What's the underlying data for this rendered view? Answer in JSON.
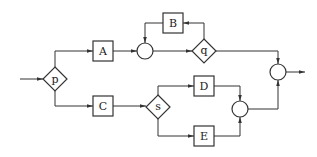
{
  "diagram": {
    "type": "flowchart",
    "nodes": {
      "p": {
        "label": "p",
        "shape": "diamond"
      },
      "q": {
        "label": "q",
        "shape": "diamond"
      },
      "s": {
        "label": "s",
        "shape": "diamond"
      },
      "A": {
        "label": "A",
        "shape": "box"
      },
      "B": {
        "label": "B",
        "shape": "box"
      },
      "C": {
        "label": "C",
        "shape": "box"
      },
      "D": {
        "label": "D",
        "shape": "box"
      },
      "E": {
        "label": "E",
        "shape": "box"
      },
      "j1": {
        "label": "",
        "shape": "circle"
      },
      "j2": {
        "label": "",
        "shape": "circle"
      },
      "j3": {
        "label": "",
        "shape": "circle"
      }
    },
    "edges": [
      {
        "from": "input",
        "to": "p"
      },
      {
        "from": "p",
        "to": "A"
      },
      {
        "from": "p",
        "to": "C"
      },
      {
        "from": "A",
        "to": "j1"
      },
      {
        "from": "j1",
        "to": "q"
      },
      {
        "from": "q",
        "to": "B"
      },
      {
        "from": "B",
        "to": "j1"
      },
      {
        "from": "q",
        "to": "j3"
      },
      {
        "from": "C",
        "to": "s"
      },
      {
        "from": "s",
        "to": "D"
      },
      {
        "from": "s",
        "to": "E"
      },
      {
        "from": "D",
        "to": "j2"
      },
      {
        "from": "E",
        "to": "j2"
      },
      {
        "from": "j2",
        "to": "j3"
      },
      {
        "from": "j3",
        "to": "output"
      }
    ]
  }
}
